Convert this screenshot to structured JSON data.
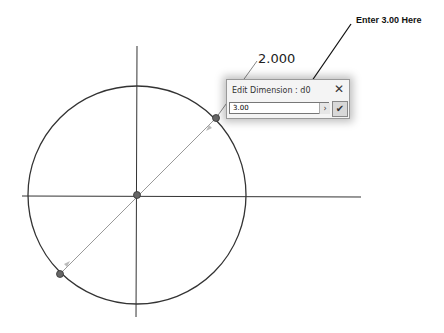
{
  "sketch": {
    "dimension_label": "2.000",
    "center": [
      137,
      195
    ],
    "radius": 109,
    "diameter_endpoints": [
      [
        216,
        118
      ],
      [
        60,
        274
      ]
    ]
  },
  "dialog": {
    "title": "Edit Dimension : d0",
    "input_value": "3.00",
    "close_icon": "close-icon",
    "arrow_icon": "chevron-right-icon",
    "ok_icon": "checkmark-icon"
  },
  "annotation": {
    "callout_text": "Enter 3.00 Here"
  }
}
